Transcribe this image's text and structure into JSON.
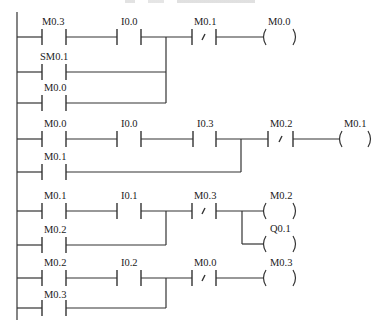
{
  "diagram": {
    "type": "ladder-logic",
    "title_visible": false,
    "rungs": [
      {
        "id": 1,
        "main": [
          "M0.3",
          "I0.0"
        ],
        "main_types": [
          "NO",
          "NO"
        ],
        "branches": [
          {
            "label": "SM0.1",
            "type": "NO"
          },
          {
            "label": "M0.0",
            "type": "NO"
          }
        ],
        "after": {
          "label": "M0.1",
          "type": "NC"
        },
        "coils": [
          "M0.0"
        ]
      },
      {
        "id": 2,
        "main": [
          "M0.0",
          "I0.0",
          "I0.3"
        ],
        "main_types": [
          "NO",
          "NO",
          "NO"
        ],
        "branches": [
          {
            "label": "M0.1",
            "type": "NO"
          }
        ],
        "after": {
          "label": "M0.2",
          "type": "NC"
        },
        "coils": [
          "M0.1"
        ]
      },
      {
        "id": 3,
        "main": [
          "M0.1",
          "I0.1"
        ],
        "main_types": [
          "NO",
          "NO"
        ],
        "branches": [
          {
            "label": "M0.2",
            "type": "NO"
          }
        ],
        "after": {
          "label": "M0.3",
          "type": "NC"
        },
        "coils": [
          "M0.2",
          "Q0.1"
        ]
      },
      {
        "id": 4,
        "main": [
          "M0.2",
          "I0.2"
        ],
        "main_types": [
          "NO",
          "NO"
        ],
        "branches": [
          {
            "label": "M0.3",
            "type": "NO"
          }
        ],
        "after": {
          "label": "M0.0",
          "type": "NC"
        },
        "coils": [
          "M0.3"
        ]
      }
    ],
    "labels": {
      "r1_c1": "M0.3",
      "r1_c2": "I0.0",
      "r1_b1": "SM0.1",
      "r1_b2": "M0.0",
      "r1_nc": "M0.1",
      "r1_coil": "M0.0",
      "r2_c1": "M0.0",
      "r2_c2": "I0.0",
      "r2_c3": "I0.3",
      "r2_b1": "M0.1",
      "r2_nc": "M0.2",
      "r2_coil": "M0.1",
      "r3_c1": "M0.1",
      "r3_c2": "I0.1",
      "r3_b1": "M0.2",
      "r3_nc": "M0.3",
      "r3_coil1": "M0.2",
      "r3_coil2": "Q0.1",
      "r4_c1": "M0.2",
      "r4_c2": "I0.2",
      "r4_b1": "M0.3",
      "r4_nc": "M0.0",
      "r4_coil": "M0.3"
    },
    "colors": {
      "line": "#333333",
      "text": "#222222",
      "background": "#ffffff"
    }
  }
}
